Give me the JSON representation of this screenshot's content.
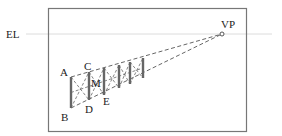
{
  "diagram": {
    "eye_level_label": "EL",
    "vanishing_point_label": "VP",
    "point_labels": {
      "A": "A",
      "B": "B",
      "C": "C",
      "D": "D",
      "E": "E",
      "M": "M"
    },
    "colors": {
      "frame": "#777777",
      "eye_level_line": "#d8d8d8",
      "posts": "#666666",
      "dashes": "#555555"
    },
    "post_count": 6
  }
}
